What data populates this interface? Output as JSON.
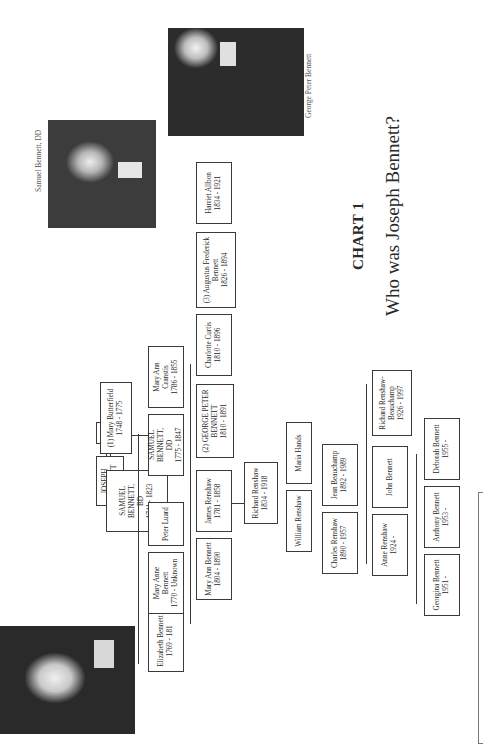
{
  "chart": {
    "heading": "CHART 1",
    "subtitle": "Who was Joseph Bennett?"
  },
  "portraits": [
    {
      "id": "left",
      "caption": ""
    },
    {
      "id": "samuel",
      "caption": "Samuel Bennett, DD"
    },
    {
      "id": "george",
      "caption": "George Peter Bennett"
    }
  ],
  "people": {
    "joseph": {
      "name": "JOSEPH BENNETT",
      "dates": ""
    },
    "jane": {
      "name": "Jane",
      "dates": ""
    },
    "samuel_sr": {
      "name": "SAMUEL BENNETT,",
      "suffix": "BD",
      "dates": "1741 - 1823"
    },
    "mary_butterfield": {
      "name": "(1) Mary Butterfield",
      "dates": "1748 - 1775"
    },
    "elizabeth": {
      "name": "Elizabeth Bennett",
      "dates": "1769 - 181"
    },
    "mary_anne": {
      "name": "Mary Anne Bennett",
      "dates": "1770 - Unknown"
    },
    "peter_luard": {
      "name": "Peter Luard",
      "dates": ""
    },
    "samuel_jr": {
      "name": "SAMUEL BENNETT,",
      "suffix": "DD",
      "dates": "1775 - 1847"
    },
    "mary_ann_cranstis": {
      "name": "Mary Ann Cranstis",
      "dates": "1786 - 1855"
    },
    "mary_ann_bennett": {
      "name": "Mary Ann Bennett",
      "dates": "1804 - 1890"
    },
    "james_renshaw": {
      "name": "James Renshaw",
      "dates": "1781 - 1858"
    },
    "george_peter": {
      "name": "(2) GEORGE PETER",
      "suffix": "BENNETT",
      "dates": "1810 - 1891"
    },
    "charlotte_curtis": {
      "name": "Charlotte Curtis",
      "dates": "1810 - 1896"
    },
    "augustus": {
      "name": "(3) Augustus Frederick",
      "suffix": "Bennett",
      "dates": "1826 - 1894"
    },
    "harriet_allbon": {
      "name": "Harriet Allbon",
      "dates": "1834 - 1921"
    },
    "richard_renshaw": {
      "name": "Richard Renshaw",
      "dates": "1834 - 1918"
    },
    "william_renshaw": {
      "name": "William Renshaw",
      "dates": ""
    },
    "maria_hands": {
      "name": "Maria Hands",
      "dates": ""
    },
    "charles_renshaw": {
      "name": "Charles Renshaw",
      "dates": "1890 - 1957"
    },
    "jean_beauchamp": {
      "name": "Jean Beauchamp",
      "dates": "1892 - 1989"
    },
    "anne_renshaw": {
      "name": "Anne Renshaw",
      "dates": "1924 -"
    },
    "john_bennett": {
      "name": "John Bennett",
      "dates": ""
    },
    "richard_rb": {
      "name": "Richard Renshaw-",
      "suffix": "Beauchamp",
      "dates": "1926 - 1997"
    },
    "georgina": {
      "name": "Georgina Bennett",
      "dates": "1951 -"
    },
    "anthony": {
      "name": "Anthony Bennett",
      "dates": "1953 -"
    },
    "deborah": {
      "name": "Deborah Bennett",
      "dates": "1955 -"
    }
  }
}
